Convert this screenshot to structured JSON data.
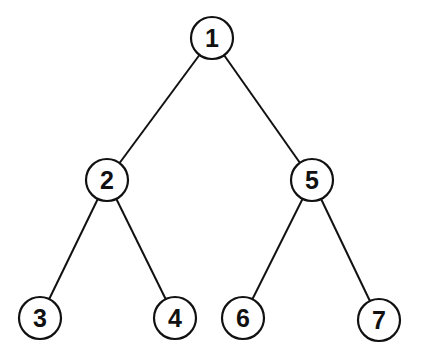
{
  "diagram": {
    "type": "binary-tree",
    "colors": {
      "stroke": "#111111",
      "fill": "#ffffff",
      "text": "#111111"
    },
    "nodes": [
      {
        "id": "1",
        "label": "1",
        "x": 212,
        "y": 38
      },
      {
        "id": "2",
        "label": "2",
        "x": 107,
        "y": 180
      },
      {
        "id": "5",
        "label": "5",
        "x": 312,
        "y": 180
      },
      {
        "id": "3",
        "label": "3",
        "x": 40,
        "y": 318
      },
      {
        "id": "4",
        "label": "4",
        "x": 175,
        "y": 318
      },
      {
        "id": "6",
        "label": "6",
        "x": 243,
        "y": 318
      },
      {
        "id": "7",
        "label": "7",
        "x": 379,
        "y": 320
      }
    ],
    "edges": [
      {
        "from": "1",
        "to": "2"
      },
      {
        "from": "1",
        "to": "5"
      },
      {
        "from": "2",
        "to": "3"
      },
      {
        "from": "2",
        "to": "4"
      },
      {
        "from": "5",
        "to": "6"
      },
      {
        "from": "5",
        "to": "7"
      }
    ]
  }
}
